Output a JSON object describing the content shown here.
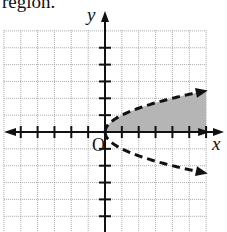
{
  "caption": "region.",
  "chart_data": {
    "type": "area",
    "title": "",
    "xlabel": "x",
    "ylabel": "y",
    "origin_label": "O",
    "xlim": [
      -6,
      6
    ],
    "ylim": [
      -6,
      6
    ],
    "grid": true,
    "boundary": {
      "equation": "y^2 = x",
      "style": "dashed",
      "upper_branch": {
        "x": [
          0,
          1,
          2,
          3,
          4,
          5,
          6
        ],
        "y": [
          0,
          1,
          1.41,
          1.73,
          2,
          2.24,
          2.45
        ]
      },
      "lower_branch": {
        "x": [
          0,
          1,
          2,
          3,
          4,
          5,
          6
        ],
        "y": [
          0,
          -1,
          -1.41,
          -1.73,
          -2,
          -2.24,
          -2.45
        ]
      }
    },
    "shaded_region": {
      "description": "Between x-axis and upper branch y = sqrt(x), 0 <= x <= 6",
      "color": "#b5b5b5"
    },
    "colors": {
      "grid": "#a8a8a8",
      "axis": "#111111",
      "curve": "#111111",
      "shade": "#b5b5b5"
    }
  }
}
